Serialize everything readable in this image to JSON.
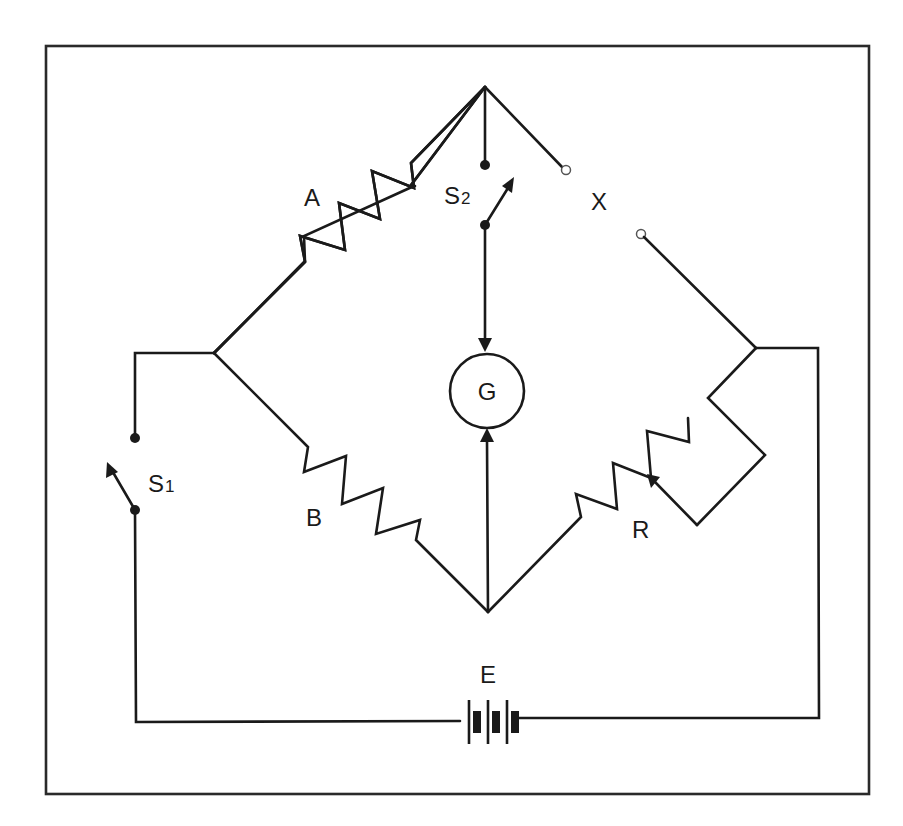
{
  "diagram": {
    "colors": {
      "stroke": "#1a1a1a",
      "background": "#ffffff",
      "frame": "#2a2a2a"
    },
    "labels": {
      "resistor_a": "A",
      "resistor_b": "B",
      "unknown_x": "X",
      "rheostat_r": "R",
      "galvanometer": "G",
      "battery": "E",
      "switch_s1_main": "S",
      "switch_s1_sub": "1",
      "switch_s2_main": "S",
      "switch_s2_sub": "2"
    },
    "components": [
      {
        "id": "A",
        "type": "resistor",
        "position": "top-left arm"
      },
      {
        "id": "B",
        "type": "resistor",
        "position": "bottom-left arm"
      },
      {
        "id": "X",
        "type": "unknown resistance (open terminals)",
        "position": "top-right arm"
      },
      {
        "id": "R",
        "type": "variable resistor (rheostat)",
        "position": "bottom-right arm"
      },
      {
        "id": "G",
        "type": "galvanometer",
        "position": "center bridge"
      },
      {
        "id": "S1",
        "type": "switch",
        "position": "battery circuit, left"
      },
      {
        "id": "S2",
        "type": "switch",
        "position": "galvanometer branch, top"
      },
      {
        "id": "E",
        "type": "battery",
        "position": "bottom"
      }
    ]
  }
}
